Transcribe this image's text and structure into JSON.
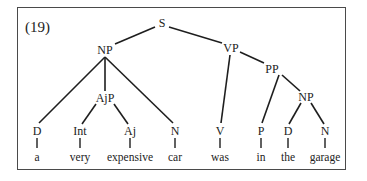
{
  "example_number": "(19)",
  "tree": {
    "nodes": [
      {
        "id": "S",
        "label": "S",
        "x": 162,
        "y": 23
      },
      {
        "id": "NP1",
        "label": "NP",
        "x": 105,
        "y": 50
      },
      {
        "id": "VP",
        "label": "VP",
        "x": 231,
        "y": 48
      },
      {
        "id": "PP",
        "label": "PP",
        "x": 272,
        "y": 69
      },
      {
        "id": "AjP",
        "label": "AjP",
        "x": 105,
        "y": 98
      },
      {
        "id": "NP2",
        "label": "NP",
        "x": 306,
        "y": 97
      },
      {
        "id": "D1",
        "label": "D",
        "x": 37,
        "y": 131
      },
      {
        "id": "Int",
        "label": "Int",
        "x": 80,
        "y": 131
      },
      {
        "id": "Aj",
        "label": "Aj",
        "x": 130,
        "y": 131
      },
      {
        "id": "N1",
        "label": "N",
        "x": 175,
        "y": 131
      },
      {
        "id": "V",
        "label": "V",
        "x": 220,
        "y": 131
      },
      {
        "id": "P",
        "label": "P",
        "x": 261,
        "y": 131
      },
      {
        "id": "D2",
        "label": "D",
        "x": 288,
        "y": 131
      },
      {
        "id": "N2",
        "label": "N",
        "x": 325,
        "y": 131
      }
    ],
    "words": [
      {
        "label": "a",
        "x": 37,
        "y": 157
      },
      {
        "label": "very",
        "x": 80,
        "y": 157
      },
      {
        "label": "expensive",
        "x": 130,
        "y": 157
      },
      {
        "label": "car",
        "x": 175,
        "y": 157
      },
      {
        "label": "was",
        "x": 220,
        "y": 157
      },
      {
        "label": "in",
        "x": 261,
        "y": 157
      },
      {
        "label": "the",
        "x": 288,
        "y": 157
      },
      {
        "label": "garage",
        "x": 325,
        "y": 157
      }
    ],
    "edges": [
      [
        155,
        27,
        115,
        44
      ],
      [
        169,
        27,
        222,
        43
      ],
      [
        105,
        57,
        39,
        123
      ],
      [
        105,
        57,
        105,
        91
      ],
      [
        105,
        57,
        173,
        123
      ],
      [
        96,
        104,
        82,
        124
      ],
      [
        114,
        104,
        128,
        124
      ],
      [
        230,
        55,
        221,
        123
      ],
      [
        240,
        52,
        264,
        63
      ],
      [
        279,
        75,
        262,
        123
      ],
      [
        282,
        75,
        300,
        91
      ],
      [
        301,
        103,
        289,
        124
      ],
      [
        311,
        103,
        324,
        124
      ]
    ],
    "leaf_ticks": [
      [
        37,
        138,
        37,
        148
      ],
      [
        80,
        138,
        80,
        148
      ],
      [
        130,
        138,
        130,
        148
      ],
      [
        175,
        138,
        175,
        148
      ],
      [
        220,
        138,
        220,
        148
      ],
      [
        261,
        138,
        261,
        148
      ],
      [
        288,
        138,
        288,
        148
      ],
      [
        325,
        138,
        325,
        148
      ]
    ],
    "line_color": "#1e1e1e"
  }
}
